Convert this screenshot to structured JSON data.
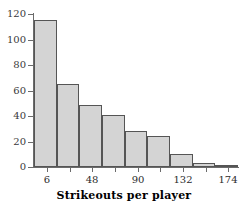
{
  "chart_data": {
    "type": "bar",
    "title": "",
    "xlabel": "Strikeouts per player",
    "ylabel": "",
    "categories": [
      "6",
      "27",
      "48",
      "69",
      "90",
      "111",
      "132",
      "153",
      "174"
    ],
    "values": [
      115,
      65,
      49,
      41,
      28,
      24,
      10,
      3,
      1
    ],
    "bin_edges": [
      -6,
      15,
      36,
      57,
      78,
      99,
      120,
      141,
      162,
      183
    ],
    "bin_width": 21,
    "xlim": [
      -6,
      183
    ],
    "ylim": [
      0,
      120
    ],
    "y_ticks": [
      0,
      20,
      40,
      60,
      80,
      100,
      120
    ],
    "y_tick_labels": [
      "0",
      "20",
      "40",
      "60",
      "80",
      "100",
      "120"
    ],
    "x_ticks": [
      6,
      27,
      48,
      69,
      90,
      111,
      132,
      153,
      174
    ],
    "x_tick_labels": [
      "6",
      "",
      "48",
      "",
      "90",
      "",
      "132",
      "",
      "174"
    ],
    "x_labeled_ticks": [
      {
        "value": 6,
        "label": "6"
      },
      {
        "value": 48,
        "label": "48"
      },
      {
        "value": 90,
        "label": "90"
      },
      {
        "value": 132,
        "label": "132"
      },
      {
        "value": 174,
        "label": "174"
      }
    ],
    "grid": false,
    "legend": null,
    "bar_fill_color": "#d4d4d4",
    "bar_edge_color": "#555555",
    "axis_color": "#6b6b6b"
  },
  "axis": {
    "x_title": "Strikeouts per player"
  }
}
